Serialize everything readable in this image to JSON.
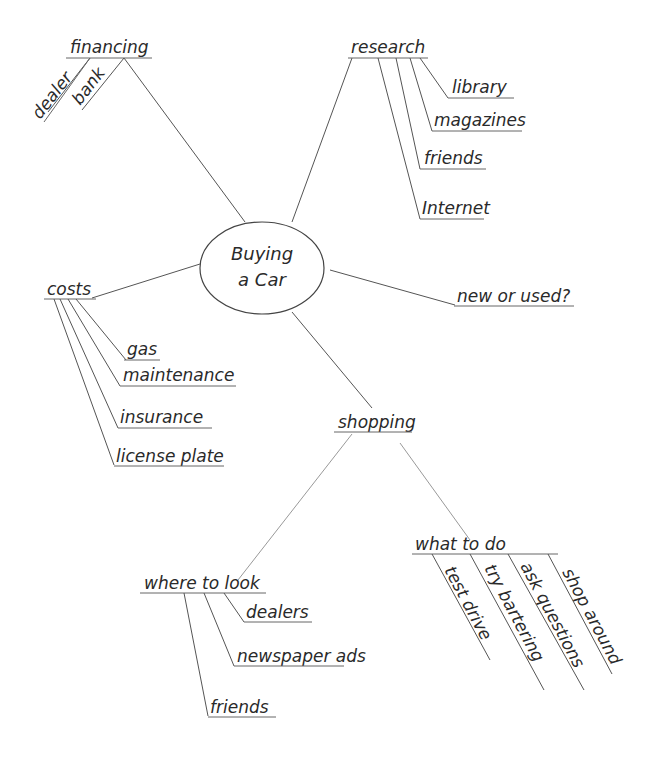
{
  "diagram": {
    "type": "mind-map",
    "center": {
      "line1": "Buying",
      "line2": "a Car"
    },
    "branches": {
      "financing": {
        "label": "financing",
        "children": [
          "dealer",
          "bank"
        ]
      },
      "research": {
        "label": "research",
        "children": [
          "library",
          "magazines",
          "friends",
          "Internet"
        ]
      },
      "costs": {
        "label": "costs",
        "children": [
          "gas",
          "maintenance",
          "insurance",
          "license plate"
        ]
      },
      "new_or_used": {
        "label": "new or used?"
      },
      "shopping": {
        "label": "shopping",
        "where_to_look": {
          "label": "where to look",
          "children": [
            "dealers",
            "newspaper ads",
            "friends"
          ]
        },
        "what_to_do": {
          "label": "what to do",
          "children": [
            "test drive",
            "try bartering",
            "ask questions",
            "shop around"
          ]
        }
      }
    }
  }
}
